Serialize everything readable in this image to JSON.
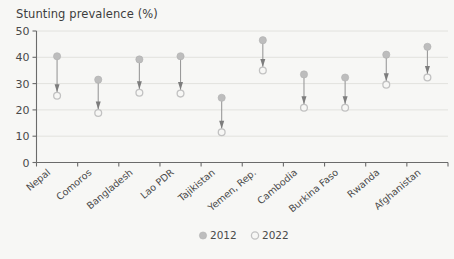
{
  "chart_data": {
    "type": "scatter",
    "title": "Stunting prevalence (%)",
    "subtitle": "",
    "xlabel": "",
    "ylabel": "",
    "ylim": [
      0,
      50
    ],
    "yticks": [
      0,
      10,
      20,
      30,
      40,
      50
    ],
    "grid": true,
    "legend_position": "bottom-center",
    "annotation": "Arrows point from 2012 value down to 2022 value",
    "categories": [
      "Nepal",
      "Comoros",
      "Bangladesh",
      "Lao PDR",
      "Tajikistan",
      "Yemen, Rep.",
      "Cambodia",
      "Burkina Faso",
      "Rwanda",
      "Afghanistan"
    ],
    "series": [
      {
        "name": "2012",
        "marker": "filled-circle",
        "color": "#bdbdbd",
        "values": [
          40.4,
          31.5,
          39.2,
          40.4,
          24.6,
          46.5,
          33.5,
          32.3,
          41.0,
          44.0
        ]
      },
      {
        "name": "2022",
        "marker": "open-circle",
        "color": "#f7f7f5",
        "values": [
          25.4,
          18.8,
          26.5,
          26.2,
          11.5,
          35.0,
          20.8,
          20.8,
          29.6,
          32.3
        ]
      }
    ]
  },
  "legend": {
    "items": [
      {
        "label": "2012"
      },
      {
        "label": "2022"
      }
    ]
  }
}
